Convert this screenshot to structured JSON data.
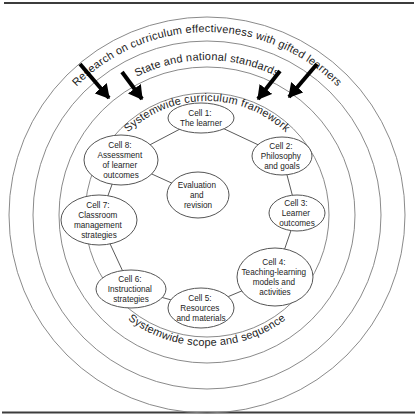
{
  "rings": [
    {
      "label": "Research on curriculum effectiveness with gifted learners"
    },
    {
      "label": "State and national standards"
    },
    {
      "label": "Systemwide curriculum framework"
    },
    {
      "label": "Systemwide scope and sequence"
    }
  ],
  "cells": [
    {
      "id": "cell-1",
      "lines": [
        "Cell 1:",
        "The learner"
      ]
    },
    {
      "id": "cell-2",
      "lines": [
        "Cell 2:",
        "Philosophy",
        "and goals"
      ]
    },
    {
      "id": "cell-3",
      "lines": [
        "Cell 3:",
        "Learner",
        "outcomes"
      ]
    },
    {
      "id": "cell-4",
      "lines": [
        "Cell 4:",
        "Teaching-learning",
        "models and",
        "activities"
      ]
    },
    {
      "id": "cell-5",
      "lines": [
        "Cell 5:",
        "Resources",
        "and materials"
      ]
    },
    {
      "id": "cell-6",
      "lines": [
        "Cell 6:",
        "Instructional",
        "strategies"
      ]
    },
    {
      "id": "cell-7",
      "lines": [
        "Cell 7:",
        "Classroom",
        "management",
        "strategies"
      ]
    },
    {
      "id": "cell-8",
      "lines": [
        "Cell 8:",
        "Assessment",
        "of learner",
        "outcomes"
      ]
    },
    {
      "id": "center",
      "lines": [
        "Evaluation",
        "and",
        "revision"
      ]
    }
  ],
  "colors": {
    "background": "#ffffff",
    "ring_line": "#7d7d7d",
    "ellipse_line": "#555555",
    "text": "#1c1c1c",
    "arrow": "#000000",
    "frame_rule": "#3c3c3c"
  }
}
